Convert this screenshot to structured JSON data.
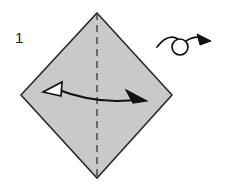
{
  "figure": {
    "kind": "origami-instruction-diagram",
    "step_number": "1",
    "background_color": "#ffffff"
  },
  "paper": {
    "name": "square-sheet",
    "orientation_label": "diamond",
    "fill_color": "#c9c9c9",
    "stroke_color": "#2b2b2b",
    "vertices": {
      "top": [
        97,
        13
      ],
      "right": [
        172,
        95
      ],
      "bottom": [
        97,
        178
      ],
      "left": [
        21,
        95
      ]
    }
  },
  "fold_line": {
    "name": "vertical-center-crease",
    "type": "dashed",
    "label": "valley fold",
    "color": "#4a4a4a",
    "from": [
      97,
      13
    ],
    "to": [
      97,
      178
    ]
  },
  "fold_arrow": {
    "name": "fold-and-unfold-arrow",
    "label": "fold in half and unfold",
    "color": "#111111",
    "left_head_style": "hollow",
    "right_head_style": "solid",
    "left_tip": [
      43,
      92
    ],
    "right_tip": [
      147,
      101
    ]
  },
  "turn_over_symbol": {
    "name": "turn-over-arrow",
    "label": "turn over",
    "color": "#111111",
    "loop_center": [
      180,
      47
    ],
    "loop_radius": 8,
    "tail_start": [
      157,
      46
    ],
    "arrow_tip": [
      211,
      41
    ]
  }
}
